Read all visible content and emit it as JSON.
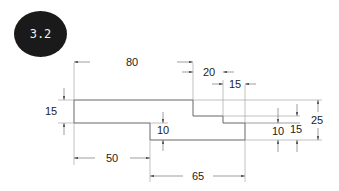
{
  "figure": {
    "badge": "3.2",
    "dimensions": {
      "top_length": "80",
      "step_20": "20",
      "step_15": "15",
      "left_height": "15",
      "inner_drop": "10",
      "right_10": "10",
      "right_15": "15",
      "right_25": "25",
      "bottom_50": "50",
      "bottom_65": "65"
    },
    "colors": {
      "line": "#555555",
      "dim_line": "#8a8a8a",
      "badge_bg": "#1a1a1a"
    }
  }
}
